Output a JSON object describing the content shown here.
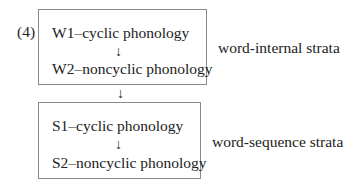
{
  "example_number": "(4)",
  "word_internal": {
    "label": "word-internal strata",
    "stratum1": "W1–cyclic phonology",
    "arrow": "↓",
    "stratum2": "W2–noncyclic phonology"
  },
  "between_arrow": "↓",
  "word_sequence": {
    "label": "word-sequence strata",
    "stratum1": "S1–cyclic phonology",
    "arrow": "↓",
    "stratum2": "S2–noncyclic phonology"
  }
}
